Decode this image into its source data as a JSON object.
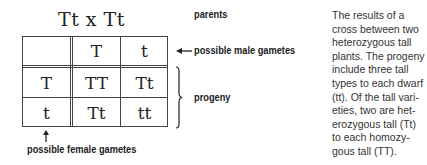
{
  "diagram": {
    "parents_cross": "Tt x Tt",
    "labels": {
      "parents": "parents",
      "male_gametes": "possible male gametes",
      "progeny": "progeny",
      "female_gametes": "possible female gametes"
    },
    "punnett": {
      "male_gametes": [
        "T",
        "t"
      ],
      "female_gametes": [
        "T",
        "t"
      ],
      "offspring": [
        [
          "TT",
          "Tt"
        ],
        [
          "Tt",
          "tt"
        ]
      ]
    },
    "icons": {
      "male_arrow": "arrow-left-icon",
      "female_arrow": "arrow-up-icon",
      "progeny_brace": "right-brace-icon"
    }
  },
  "caption": {
    "lines": [
      "The results of a",
      "cross between two",
      "heterozygous tall",
      "plants. The progeny",
      "include three tall",
      "types to each dwarf",
      "(tt). Of the tall vari-",
      "eties, two are het-",
      "erozygous tall (Tt)",
      "to each homozy-",
      "gous tall (TT)."
    ]
  }
}
